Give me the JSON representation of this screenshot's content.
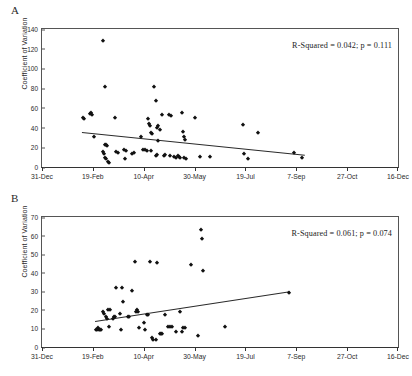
{
  "figure": {
    "ylabel": "Coefficient of Variation",
    "x_axis": {
      "tick_labels": [
        "31-Dec",
        "19-Feb",
        "10-Apr",
        "30-May",
        "19-Jul",
        "7-Sep",
        "27-Oct",
        "16-Dec"
      ],
      "tick_positions_frac": [
        0,
        0.1429,
        0.2857,
        0.4286,
        0.5714,
        0.7143,
        0.8571,
        1.0
      ]
    }
  },
  "chart_data": [
    {
      "panel": "A",
      "type": "scatter",
      "title": "",
      "xlabel": "",
      "ylabel": "Coefficient of Variation",
      "xlim": [
        0,
        350
      ],
      "ylim": [
        0,
        140
      ],
      "x_tick_labels": [
        "31-Dec",
        "19-Feb",
        "10-Apr",
        "30-May",
        "19-Jul",
        "7-Sep",
        "27-Oct",
        "16-Dec"
      ],
      "x_tick_values": [
        0,
        50,
        100,
        150,
        200,
        250,
        300,
        350
      ],
      "y_tick_values": [
        0,
        20,
        40,
        60,
        80,
        100,
        120,
        140
      ],
      "grid": false,
      "annotation": "R-Squared = 0.042; p = 0.111",
      "r_squared": 0.042,
      "p_value": 0.111,
      "trendline": {
        "x0": 39,
        "y0": 36,
        "x1": 258,
        "y1": 13
      },
      "points": [
        {
          "x": 40,
          "y": 50
        },
        {
          "x": 41,
          "y": 49
        },
        {
          "x": 47,
          "y": 54
        },
        {
          "x": 48,
          "y": 55
        },
        {
          "x": 49,
          "y": 53
        },
        {
          "x": 51,
          "y": 30
        },
        {
          "x": 60,
          "y": 128
        },
        {
          "x": 62,
          "y": 81
        },
        {
          "x": 60,
          "y": 15
        },
        {
          "x": 61,
          "y": 13
        },
        {
          "x": 62,
          "y": 22
        },
        {
          "x": 63,
          "y": 22
        },
        {
          "x": 64,
          "y": 21
        },
        {
          "x": 62,
          "y": 9
        },
        {
          "x": 63,
          "y": 8
        },
        {
          "x": 65,
          "y": 5
        },
        {
          "x": 66,
          "y": 4
        },
        {
          "x": 72,
          "y": 50
        },
        {
          "x": 73,
          "y": 15
        },
        {
          "x": 75,
          "y": 14
        },
        {
          "x": 81,
          "y": 17
        },
        {
          "x": 83,
          "y": 16
        },
        {
          "x": 82,
          "y": 8
        },
        {
          "x": 88,
          "y": 13
        },
        {
          "x": 90,
          "y": 14
        },
        {
          "x": 97,
          "y": 30
        },
        {
          "x": 99,
          "y": 17
        },
        {
          "x": 101,
          "y": 17
        },
        {
          "x": 103,
          "y": 16
        },
        {
          "x": 104,
          "y": 49
        },
        {
          "x": 105,
          "y": 44
        },
        {
          "x": 106,
          "y": 42
        },
        {
          "x": 107,
          "y": 34
        },
        {
          "x": 108,
          "y": 33
        },
        {
          "x": 107,
          "y": 16
        },
        {
          "x": 110,
          "y": 81
        },
        {
          "x": 112,
          "y": 67
        },
        {
          "x": 113,
          "y": 40
        },
        {
          "x": 112,
          "y": 11
        },
        {
          "x": 113,
          "y": 12
        },
        {
          "x": 114,
          "y": 26
        },
        {
          "x": 116,
          "y": 38
        },
        {
          "x": 114,
          "y": 42
        },
        {
          "x": 118,
          "y": 53
        },
        {
          "x": 120,
          "y": 11
        },
        {
          "x": 121,
          "y": 12
        },
        {
          "x": 125,
          "y": 53
        },
        {
          "x": 127,
          "y": 52
        },
        {
          "x": 126,
          "y": 11
        },
        {
          "x": 130,
          "y": 10
        },
        {
          "x": 132,
          "y": 9
        },
        {
          "x": 134,
          "y": 11
        },
        {
          "x": 135,
          "y": 10
        },
        {
          "x": 136,
          "y": 9
        },
        {
          "x": 138,
          "y": 55
        },
        {
          "x": 139,
          "y": 36
        },
        {
          "x": 140,
          "y": 30
        },
        {
          "x": 141,
          "y": 27
        },
        {
          "x": 140,
          "y": 9
        },
        {
          "x": 142,
          "y": 8
        },
        {
          "x": 150,
          "y": 50
        },
        {
          "x": 155,
          "y": 10
        },
        {
          "x": 165,
          "y": 10
        },
        {
          "x": 198,
          "y": 43
        },
        {
          "x": 199,
          "y": 13
        },
        {
          "x": 203,
          "y": 8
        },
        {
          "x": 212,
          "y": 35
        },
        {
          "x": 248,
          "y": 14
        },
        {
          "x": 256,
          "y": 9
        }
      ]
    },
    {
      "panel": "B",
      "type": "scatter",
      "title": "",
      "xlabel": "",
      "ylabel": "Coefficient of Variation",
      "xlim": [
        0,
        350
      ],
      "ylim": [
        0,
        70
      ],
      "x_tick_labels": [
        "31-Dec",
        "19-Feb",
        "10-Apr",
        "30-May",
        "19-Jul",
        "7-Sep",
        "27-Oct",
        "16-Dec"
      ],
      "x_tick_values": [
        0,
        50,
        100,
        150,
        200,
        250,
        300,
        350
      ],
      "y_tick_values": [
        0,
        10,
        20,
        30,
        40,
        50,
        60,
        70
      ],
      "grid": false,
      "annotation": "R-Squared = 0.061; p = 0.074",
      "r_squared": 0.061,
      "p_value": 0.074,
      "trendline": {
        "x0": 52,
        "y0": 14,
        "x1": 243,
        "y1": 30
      },
      "points": [
        {
          "x": 53,
          "y": 9
        },
        {
          "x": 54,
          "y": 9
        },
        {
          "x": 55,
          "y": 10
        },
        {
          "x": 56,
          "y": 9
        },
        {
          "x": 57,
          "y": 9
        },
        {
          "x": 58,
          "y": 9
        },
        {
          "x": 60,
          "y": 19
        },
        {
          "x": 61,
          "y": 18
        },
        {
          "x": 63,
          "y": 16
        },
        {
          "x": 64,
          "y": 15
        },
        {
          "x": 65,
          "y": 20
        },
        {
          "x": 67,
          "y": 20
        },
        {
          "x": 66,
          "y": 11
        },
        {
          "x": 70,
          "y": 15
        },
        {
          "x": 71,
          "y": 16
        },
        {
          "x": 72,
          "y": 16
        },
        {
          "x": 73,
          "y": 32
        },
        {
          "x": 77,
          "y": 18
        },
        {
          "x": 79,
          "y": 32
        },
        {
          "x": 80,
          "y": 24
        },
        {
          "x": 78,
          "y": 9
        },
        {
          "x": 85,
          "y": 16
        },
        {
          "x": 86,
          "y": 16
        },
        {
          "x": 88,
          "y": 30
        },
        {
          "x": 91,
          "y": 46
        },
        {
          "x": 92,
          "y": 19
        },
        {
          "x": 93,
          "y": 20
        },
        {
          "x": 94,
          "y": 19
        },
        {
          "x": 95,
          "y": 10
        },
        {
          "x": 100,
          "y": 13
        },
        {
          "x": 101,
          "y": 9
        },
        {
          "x": 103,
          "y": 17
        },
        {
          "x": 104,
          "y": 17
        },
        {
          "x": 106,
          "y": 46
        },
        {
          "x": 108,
          "y": 5
        },
        {
          "x": 109,
          "y": 4
        },
        {
          "x": 113,
          "y": 45
        },
        {
          "x": 112,
          "y": 4
        },
        {
          "x": 116,
          "y": 7
        },
        {
          "x": 117,
          "y": 7
        },
        {
          "x": 118,
          "y": 7
        },
        {
          "x": 121,
          "y": 17
        },
        {
          "x": 124,
          "y": 11
        },
        {
          "x": 126,
          "y": 11
        },
        {
          "x": 128,
          "y": 11
        },
        {
          "x": 132,
          "y": 8
        },
        {
          "x": 136,
          "y": 19
        },
        {
          "x": 139,
          "y": 10
        },
        {
          "x": 141,
          "y": 10
        },
        {
          "x": 138,
          "y": 8
        },
        {
          "x": 146,
          "y": 44
        },
        {
          "x": 156,
          "y": 63
        },
        {
          "x": 157,
          "y": 58
        },
        {
          "x": 158,
          "y": 41
        },
        {
          "x": 153,
          "y": 6
        },
        {
          "x": 180,
          "y": 11
        },
        {
          "x": 243,
          "y": 29
        }
      ]
    }
  ]
}
